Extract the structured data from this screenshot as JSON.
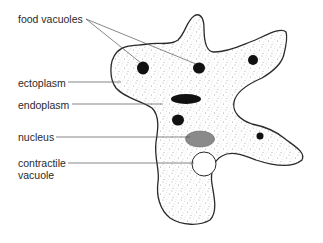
{
  "diagram": {
    "labels": [
      {
        "id": "food-vacuoles",
        "text": "food vacuoles",
        "x": 18,
        "y": 13
      },
      {
        "id": "ectoplasm",
        "text": "ectoplasm",
        "x": 18,
        "y": 77
      },
      {
        "id": "endoplasm",
        "text": "endoplasm",
        "x": 18,
        "y": 99
      },
      {
        "id": "nucleus",
        "text": "nucleus",
        "x": 18,
        "y": 131
      },
      {
        "id": "contractile-vacuole",
        "text": "contractile\nvacuole",
        "x": 18,
        "y": 157
      }
    ],
    "colors": {
      "outline": "#2a2a2a",
      "cytoplasm_stipple": "#555555",
      "food_vacuole": "#111111",
      "nucleus": "#8a8a8a",
      "contractile_vacuole": "#ffffff",
      "leader_line": "#555555",
      "text": "#2a2a2a"
    }
  }
}
